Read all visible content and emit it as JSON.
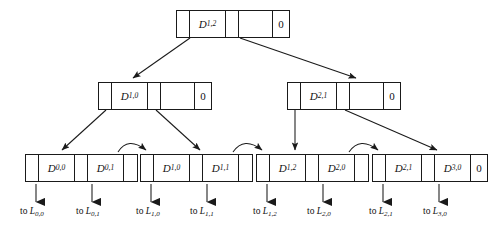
{
  "diagram": {
    "type": "tree-diagram",
    "colors": {
      "stroke": "#1a1a1a",
      "fill": "#ffffff",
      "text": "#111111"
    },
    "levels": [
      {
        "level": 0,
        "role": "root",
        "nodes": [
          {
            "id": "root",
            "x": 176,
            "y": 10,
            "cells": [
              {
                "kind": "pointer",
                "label": ""
              },
              {
                "kind": "key",
                "label": "D",
                "sub": "1,2"
              },
              {
                "kind": "pointer",
                "label": ""
              },
              {
                "kind": "pointer-wide",
                "label": ""
              },
              {
                "kind": "zero",
                "label": "0"
              }
            ]
          }
        ]
      },
      {
        "level": 1,
        "role": "internal",
        "nodes": [
          {
            "id": "internal-left",
            "x": 98,
            "y": 82,
            "cells": [
              {
                "kind": "pointer",
                "label": ""
              },
              {
                "kind": "key",
                "label": "D",
                "sub": "1,0"
              },
              {
                "kind": "pointer",
                "label": ""
              },
              {
                "kind": "pointer-wide",
                "label": ""
              },
              {
                "kind": "zero",
                "label": "0"
              }
            ]
          },
          {
            "id": "internal-right",
            "x": 287,
            "y": 82,
            "cells": [
              {
                "kind": "pointer",
                "label": ""
              },
              {
                "kind": "key",
                "label": "D",
                "sub": "2,1"
              },
              {
                "kind": "pointer",
                "label": ""
              },
              {
                "kind": "pointer-wide",
                "label": ""
              },
              {
                "kind": "zero",
                "label": "0"
              }
            ]
          }
        ]
      },
      {
        "level": 2,
        "role": "leaf",
        "nodes": [
          {
            "id": "leaf-0",
            "x": 25,
            "y": 154,
            "cells": [
              {
                "kind": "pointer",
                "label": ""
              },
              {
                "kind": "key",
                "label": "D",
                "sub": "0,0"
              },
              {
                "kind": "pointer",
                "label": ""
              },
              {
                "kind": "key",
                "label": "D",
                "sub": "0,1"
              },
              {
                "kind": "pointer",
                "label": ""
              }
            ]
          },
          {
            "id": "leaf-1",
            "x": 140,
            "y": 154,
            "cells": [
              {
                "kind": "pointer",
                "label": ""
              },
              {
                "kind": "key",
                "label": "D",
                "sub": "1,0"
              },
              {
                "kind": "pointer",
                "label": ""
              },
              {
                "kind": "key",
                "label": "D",
                "sub": "1,1"
              },
              {
                "kind": "pointer",
                "label": ""
              }
            ]
          },
          {
            "id": "leaf-2",
            "x": 256,
            "y": 154,
            "cells": [
              {
                "kind": "pointer",
                "label": ""
              },
              {
                "kind": "key",
                "label": "D",
                "sub": "1,2"
              },
              {
                "kind": "pointer",
                "label": ""
              },
              {
                "kind": "key",
                "label": "D",
                "sub": "2,0"
              },
              {
                "kind": "pointer",
                "label": ""
              }
            ]
          },
          {
            "id": "leaf-3",
            "x": 372,
            "y": 154,
            "cells": [
              {
                "kind": "pointer",
                "label": ""
              },
              {
                "kind": "key",
                "label": "D",
                "sub": "2,1"
              },
              {
                "kind": "pointer",
                "label": ""
              },
              {
                "kind": "key",
                "label": "D",
                "sub": "3,0"
              },
              {
                "kind": "zero",
                "label": "0"
              }
            ]
          }
        ]
      }
    ],
    "leaf_targets": [
      {
        "id": "to-L-0-0",
        "prefix": "to ",
        "symbol": "L",
        "sub": "0,0",
        "x": 20,
        "y": 206,
        "arrow_x": 36,
        "arrow_y0": 184,
        "arrow_y1": 202
      },
      {
        "id": "to-L-0-1",
        "prefix": "to ",
        "symbol": "L",
        "sub": "0,1",
        "x": 76,
        "y": 206,
        "arrow_x": 92,
        "arrow_y0": 184,
        "arrow_y1": 202
      },
      {
        "id": "to-L-1-0",
        "prefix": "to ",
        "symbol": "L",
        "sub": "1,0",
        "x": 136,
        "y": 206,
        "arrow_x": 151,
        "arrow_y0": 184,
        "arrow_y1": 202
      },
      {
        "id": "to-L-1-1",
        "prefix": "to ",
        "symbol": "L",
        "sub": "1,1",
        "x": 190,
        "y": 206,
        "arrow_x": 207,
        "arrow_y0": 184,
        "arrow_y1": 202
      },
      {
        "id": "to-L-1-2",
        "prefix": "to ",
        "symbol": "L",
        "sub": "1,2",
        "x": 253,
        "y": 206,
        "arrow_x": 267,
        "arrow_y0": 184,
        "arrow_y1": 202
      },
      {
        "id": "to-L-2-0",
        "prefix": "to ",
        "symbol": "L",
        "sub": "2,0",
        "x": 307,
        "y": 206,
        "arrow_x": 323,
        "arrow_y0": 184,
        "arrow_y1": 202
      },
      {
        "id": "to-L-2-1",
        "prefix": "to ",
        "symbol": "L",
        "sub": "2,1",
        "x": 369,
        "y": 206,
        "arrow_x": 383,
        "arrow_y0": 184,
        "arrow_y1": 202
      },
      {
        "id": "to-L-3-0",
        "prefix": "to ",
        "symbol": "L",
        "sub": "3,0",
        "x": 423,
        "y": 206,
        "arrow_x": 439,
        "arrow_y0": 184,
        "arrow_y1": 202
      }
    ],
    "edges": [
      {
        "id": "root-to-internal-left",
        "kind": "straight",
        "x1": 190,
        "y1": 38,
        "x2": 133,
        "y2": 78
      },
      {
        "id": "root-to-internal-right",
        "kind": "straight",
        "x1": 240,
        "y1": 38,
        "x2": 356,
        "y2": 78
      },
      {
        "id": "internal-left-to-leaf-0",
        "kind": "straight",
        "x1": 106,
        "y1": 110,
        "x2": 62,
        "y2": 150
      },
      {
        "id": "internal-left-to-leaf-1",
        "kind": "straight",
        "x1": 156,
        "y1": 110,
        "x2": 200,
        "y2": 150
      },
      {
        "id": "internal-right-to-leaf-2",
        "kind": "straight",
        "x1": 295,
        "y1": 110,
        "x2": 295,
        "y2": 150
      },
      {
        "id": "internal-right-to-leaf-3",
        "kind": "straight",
        "x1": 345,
        "y1": 110,
        "x2": 437,
        "y2": 150
      },
      {
        "id": "leaf-0-to-leaf-1",
        "kind": "curve",
        "x1": 118,
        "y1": 152,
        "cx": 128,
        "cy": 136,
        "x2": 146,
        "y2": 150
      },
      {
        "id": "leaf-1-to-leaf-2",
        "kind": "curve",
        "x1": 233,
        "y1": 152,
        "cx": 244,
        "cy": 136,
        "x2": 262,
        "y2": 150
      },
      {
        "id": "leaf-2-to-leaf-3",
        "kind": "curve",
        "x1": 349,
        "y1": 152,
        "cx": 360,
        "cy": 136,
        "x2": 378,
        "y2": 150
      }
    ]
  }
}
